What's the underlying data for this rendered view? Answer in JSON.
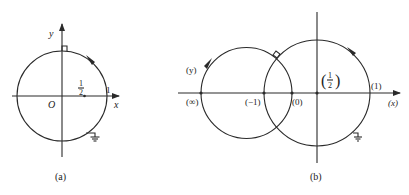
{
  "figure_a": {
    "caption": "(a)",
    "x_axis_label": "x",
    "y_axis_label": "y",
    "origin_label": "O",
    "half_label_num": "1",
    "half_label_den": "2",
    "one_label": "1",
    "circle_direction": "counterclockwise",
    "ground_symbol": "ground-icon"
  },
  "figure_b": {
    "caption": "(b)",
    "x_axis_label": "(x)",
    "y_label": "(y)",
    "points": [
      {
        "label": "(∞)",
        "value": "infinity"
      },
      {
        "label": "(−1)",
        "value": "-1"
      },
      {
        "label": "(0)",
        "value": "0"
      },
      {
        "label": "(1)",
        "value": "1"
      }
    ],
    "half_label_num": "1",
    "half_label_den": "2",
    "ground_symbol": "ground-icon"
  }
}
